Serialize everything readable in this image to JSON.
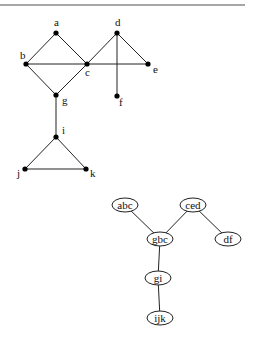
{
  "graph": {
    "nodes": [
      {
        "id": "a",
        "label": "a",
        "x": 56,
        "y": 33,
        "lx": 54,
        "ly": 26
      },
      {
        "id": "b",
        "label": "b",
        "x": 26,
        "y": 64,
        "lx": 20,
        "ly": 59
      },
      {
        "id": "c",
        "label": "c",
        "x": 87,
        "y": 64,
        "lx": 85,
        "ly": 76
      },
      {
        "id": "d",
        "label": "d",
        "x": 117,
        "y": 33,
        "lx": 115,
        "ly": 26
      },
      {
        "id": "e",
        "label": "e",
        "x": 148,
        "y": 64,
        "lx": 153,
        "ly": 73
      },
      {
        "id": "f",
        "label": "f",
        "x": 117,
        "y": 96,
        "lx": 119,
        "ly": 106
      },
      {
        "id": "g",
        "label": "g",
        "x": 56,
        "y": 95,
        "lx": 62,
        "ly": 104
      },
      {
        "id": "i",
        "label": "i",
        "x": 56,
        "y": 137,
        "lx": 62,
        "ly": 134
      },
      {
        "id": "j",
        "label": "j",
        "x": 25,
        "y": 169,
        "lx": 17,
        "ly": 177
      },
      {
        "id": "k",
        "label": "k",
        "x": 86,
        "y": 169,
        "lx": 90,
        "ly": 177
      }
    ],
    "edges": [
      [
        "a",
        "b"
      ],
      [
        "a",
        "c"
      ],
      [
        "b",
        "c"
      ],
      [
        "c",
        "e"
      ],
      [
        "c",
        "d"
      ],
      [
        "d",
        "e"
      ],
      [
        "d",
        "f"
      ],
      [
        "b",
        "g"
      ],
      [
        "c",
        "g"
      ],
      [
        "g",
        "i"
      ],
      [
        "i",
        "j"
      ],
      [
        "i",
        "k"
      ],
      [
        "j",
        "k"
      ]
    ]
  },
  "tree": {
    "nodes": [
      {
        "id": "abc",
        "label": "abc",
        "x": 125,
        "y": 205
      },
      {
        "id": "ced",
        "label": "ced",
        "x": 193,
        "y": 205
      },
      {
        "id": "gbc",
        "label": "gbc",
        "x": 160,
        "y": 239
      },
      {
        "id": "df",
        "label": "df",
        "x": 228,
        "y": 239
      },
      {
        "id": "gi",
        "label": "gi",
        "x": 158,
        "y": 278
      },
      {
        "id": "ijk",
        "label": "ijk",
        "x": 160,
        "y": 318
      }
    ],
    "edges": [
      [
        "abc",
        "gbc"
      ],
      [
        "ced",
        "gbc"
      ],
      [
        "ced",
        "df"
      ],
      [
        "gbc",
        "gi"
      ],
      [
        "gi",
        "ijk"
      ]
    ]
  }
}
